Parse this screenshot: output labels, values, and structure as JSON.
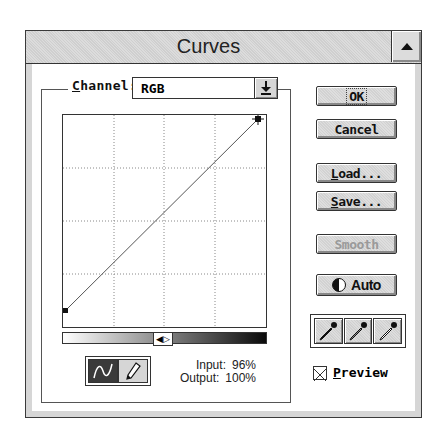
{
  "window": {
    "title": "Curves",
    "titlebar_button_icon": "up-arrow-icon"
  },
  "channel": {
    "label_prefix": "C",
    "label_rest": "hannel:",
    "value": "RGB",
    "dropdown_icon": "down-arrow-icon"
  },
  "graph": {
    "grid_divisions": 4,
    "curve_points": [
      {
        "input": 0,
        "output": 0
      },
      {
        "input": 96,
        "output": 100
      }
    ]
  },
  "gradient_bar": {
    "toggle_icon": "left-right-arrows-icon",
    "toggle_glyph": "◀▷"
  },
  "tools": {
    "curve_tool": "curve-icon",
    "pencil_tool": "pencil-icon",
    "active": "curve"
  },
  "readout": {
    "input_label": "Input:",
    "input_value": "96%",
    "output_label": "Output:",
    "output_value": "100%"
  },
  "buttons": {
    "ok": "OK",
    "cancel": "Cancel",
    "load_prefix": "L",
    "load_rest": "oad...",
    "save_prefix": "S",
    "save_rest": "ave...",
    "smooth": "Smooth",
    "auto": "Auto"
  },
  "eyedroppers": [
    {
      "name": "black-point",
      "icon": "eyedropper-black-icon"
    },
    {
      "name": "gray-point",
      "icon": "eyedropper-gray-icon"
    },
    {
      "name": "white-point",
      "icon": "eyedropper-white-icon"
    }
  ],
  "preview": {
    "label_prefix": "P",
    "label_rest": "review",
    "checked": true
  }
}
